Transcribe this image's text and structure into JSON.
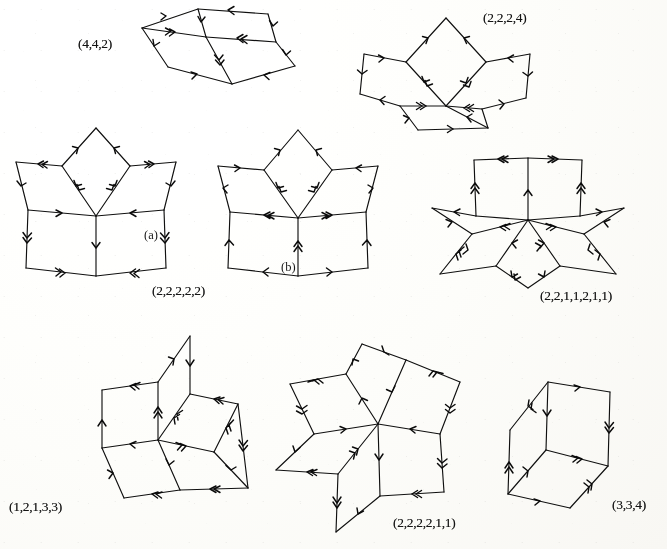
{
  "document": {
    "kind": "mathematical-figure-plate",
    "description": "Plate of eight rhombic zonotopal tilings with directed edges; each edge carries chevron tick marks indicating its zone multiplicity, and each tiling is annotated with a composition tuple.",
    "background_color": "#fdfdfb",
    "ink_color": "#121212",
    "width": 667,
    "height": 549
  },
  "figures": [
    {
      "id": "fig-442",
      "label": "(4,4,2)",
      "label_x": 78,
      "label_y": 36,
      "origin_x": 140,
      "origin_y": 4,
      "zones": 3,
      "tiles": 4,
      "shape": "oblique-rhombic-block"
    },
    {
      "id": "fig-2224",
      "label": "(2,2,2,4)",
      "label_x": 483,
      "label_y": 10,
      "origin_x": 358,
      "origin_y": 10,
      "zones": 4,
      "tiles": 6,
      "shape": "fan-rosette"
    },
    {
      "id": "fig-22222",
      "label": "(2,2,2,2,2)",
      "label_x": 152,
      "label_y": 283,
      "origin_x": 8,
      "origin_y": 124,
      "zones": 5,
      "tiles": 10,
      "shape": "five-fold-rosette",
      "sub_label": "(a)",
      "sub_label_x": 144,
      "sub_label_y": 228
    },
    {
      "id": "fig-22222-b",
      "label": "",
      "label_x": 0,
      "label_y": 0,
      "origin_x": 210,
      "origin_y": 128,
      "zones": 5,
      "tiles": 10,
      "shape": "five-fold-rosette-variant",
      "sub_label": "(b)",
      "sub_label_x": 281,
      "sub_label_y": 260
    },
    {
      "id": "fig-2211211",
      "label": "(2,2,1,1,2,1,1)",
      "label_x": 540,
      "label_y": 288,
      "origin_x": 428,
      "origin_y": 140,
      "zones": 7,
      "tiles": 12,
      "shape": "seven-fold-star"
    },
    {
      "id": "fig-12133",
      "label": "(1,2,1,3,3)",
      "label_x": 9,
      "label_y": 499,
      "origin_x": 80,
      "origin_y": 332,
      "zones": 5,
      "tiles": 7,
      "shape": "skew-rosette"
    },
    {
      "id": "fig-222211",
      "label": "(2,2,2,2,1,1)",
      "label_x": 393,
      "label_y": 515,
      "origin_x": 274,
      "origin_y": 340,
      "zones": 6,
      "tiles": 11,
      "shape": "six-fold-star"
    },
    {
      "id": "fig-334",
      "label": "(3,3,4)",
      "label_x": 612,
      "label_y": 497,
      "origin_x": 500,
      "origin_y": 360,
      "zones": 3,
      "tiles": 3,
      "shape": "cube-rosette"
    }
  ]
}
